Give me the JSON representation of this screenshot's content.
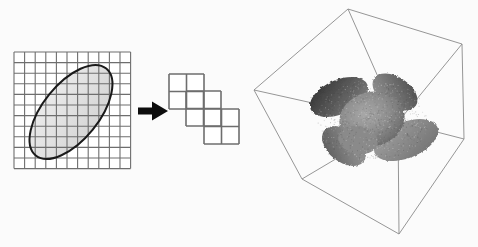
{
  "figure": {
    "width": 478,
    "height": 247,
    "background_color": "#fbfbfb"
  },
  "colors": {
    "grid_line": "#6e6e6e",
    "grid_line_dark": "#4a4a4a",
    "grid_cell_fill": "#ffffff",
    "ellipse_fill": "#e2e2e2",
    "ellipse_stroke": "#1a1a1a",
    "block_stroke": "#6e6e6e",
    "block_fill": "#ffffff",
    "arrow_fill": "#0d0d0d",
    "cube_edge": "#8a8a8a",
    "star_light": "#9c9c9c",
    "star_mid": "#777777",
    "star_dark": "#3a3a3a",
    "star_outline": "#2b2b2b"
  },
  "grid_panel": {
    "name": "source-grid",
    "origin_x": 14,
    "origin_y": 52,
    "columns": 11,
    "rows": 11,
    "cell_size": 10.6,
    "line_width": 1.1
  },
  "ellipse": {
    "name": "elliptical-region",
    "center_x": 71,
    "center_y": 112,
    "radius_x": 56,
    "radius_y": 28,
    "rotation_deg": -51,
    "stroke_width": 2.0
  },
  "arrow": {
    "name": "transform-arrow",
    "tail_x": 138,
    "tail_y": 111,
    "head_x": 168,
    "head_y": 111,
    "shaft_height": 7,
    "head_width": 16,
    "head_height": 19,
    "direction": "right",
    "label": ""
  },
  "block_stair": {
    "name": "block-decomposition",
    "cell_size": 17.5,
    "stroke_width": 1.6,
    "blocks": [
      {
        "label": "block-1",
        "x": 169,
        "y": 74,
        "cols": 2,
        "rows": 2
      },
      {
        "label": "block-2",
        "x": 186,
        "y": 91,
        "cols": 2,
        "rows": 2
      },
      {
        "label": "block-3",
        "x": 204,
        "y": 109,
        "cols": 2,
        "rows": 2
      }
    ]
  },
  "cube": {
    "name": "wireframe-cube",
    "edge_width": 0.9,
    "vertices": {
      "top": [
        348,
        9
      ],
      "upper_right": [
        462,
        44
      ],
      "left": [
        254,
        90
      ],
      "center_right": [
        464,
        139
      ],
      "center_front": [
        398,
        122
      ],
      "lower_left": [
        302,
        179
      ],
      "bottom": [
        399,
        234
      ],
      "right_lower": [
        434,
        186
      ]
    }
  },
  "star": {
    "name": "star-isosurface",
    "center_x": 372,
    "center_y": 120,
    "lobes": 6,
    "description": "three-axis cross / star shaped isosurface with gray shading"
  }
}
